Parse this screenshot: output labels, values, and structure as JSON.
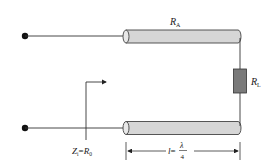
{
  "diagram": {
    "type": "quarter-wave transformer circuit",
    "labels": {
      "top_line_resistance": "R",
      "top_line_resistance_sub": "A",
      "load": "R",
      "load_sub": "L",
      "input_impedance_lhs": "Z",
      "input_impedance_lhs_sub": "i",
      "input_impedance_eq": "=",
      "input_impedance_rhs": "R",
      "input_impedance_rhs_sub": "0",
      "length_var": "l",
      "length_eq": "=",
      "length_num": "λ",
      "length_den": "4"
    },
    "colors": {
      "cable_fill": "#d6d6d6",
      "cable_stroke": "#444444",
      "resistor_fill": "#7a7a7a",
      "wire": "#333333",
      "terminal": "#111111"
    }
  }
}
